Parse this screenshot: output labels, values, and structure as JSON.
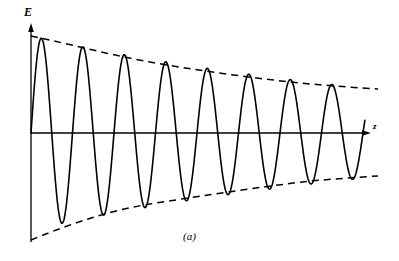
{
  "figure": {
    "caption": "(a)",
    "y_axis_label": "E",
    "x_axis_label": "z",
    "background_color": "#ffffff",
    "stroke_color": "#000000"
  },
  "chart_data": {
    "type": "line",
    "title": "",
    "subtitle": "",
    "xlabel": "z",
    "ylabel": "E",
    "grid": false,
    "legend": null,
    "axes": {
      "origin_px": [
        31,
        133
      ],
      "x_axis_from_px": [
        31,
        133
      ],
      "x_axis_to_px": [
        368,
        133
      ],
      "y_axis_from_px": [
        31,
        25
      ],
      "y_axis_to_px": [
        31,
        242
      ],
      "x_arrow": true,
      "y_arrow": true,
      "ticks": [],
      "tick_labels": []
    },
    "series": [
      {
        "name": "E(z)",
        "style": "solid",
        "form": "A0 * exp(-alpha * z) * sin(2*pi*z/period)",
        "n_cycles": 9,
        "period_px": 41.5,
        "start_x_px": 31,
        "end_x_px": 365,
        "amplitude_start_px": 97,
        "amplitude_end_px": 45,
        "peaks_x_px": [
          37,
          78,
          120,
          161,
          203,
          244,
          286,
          327,
          365
        ],
        "peaks_y_px": [
          39,
          48,
          56,
          63,
          70,
          76,
          81,
          85,
          88
        ],
        "troughs_x_px": [
          58,
          99,
          141,
          182,
          224,
          265,
          307,
          348
        ],
        "troughs_y_px": [
          222,
          214,
          206,
          199,
          193,
          187,
          182,
          178
        ]
      },
      {
        "name": "upper envelope",
        "style": "dashed",
        "points_px": [
          [
            31,
            36
          ],
          [
            90,
            51
          ],
          [
            150,
            62
          ],
          [
            210,
            71
          ],
          [
            270,
            79
          ],
          [
            330,
            85
          ],
          [
            378,
            88
          ]
        ]
      },
      {
        "name": "lower envelope",
        "style": "dashed",
        "points_px": [
          [
            31,
            239
          ],
          [
            90,
            217
          ],
          [
            150,
            204
          ],
          [
            210,
            194
          ],
          [
            270,
            186
          ],
          [
            330,
            180
          ],
          [
            378,
            177
          ]
        ]
      }
    ],
    "xlim": [
      0,
      399
    ],
    "ylim": [
      0,
      261
    ]
  }
}
